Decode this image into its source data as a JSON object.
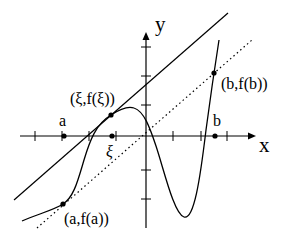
{
  "diagram": {
    "axes": {
      "x_label": "x",
      "y_label": "y"
    },
    "points": {
      "a": {
        "label": "a",
        "axis_label": "a"
      },
      "xi": {
        "label": "(ξ,f(ξ))",
        "axis_label": "ξ"
      },
      "b": {
        "label": "b",
        "axis_label": "b"
      },
      "fa": {
        "label": "(a,f(a))"
      },
      "fb": {
        "label": "(b,f(b))"
      }
    },
    "lines": {
      "tangent": "solid tangent line at (ξ,f(ξ))",
      "secant": "dotted secant through (a,f(a)) and (b,f(b))"
    },
    "colors": {
      "stroke": "#000000",
      "background": "#ffffff"
    }
  }
}
